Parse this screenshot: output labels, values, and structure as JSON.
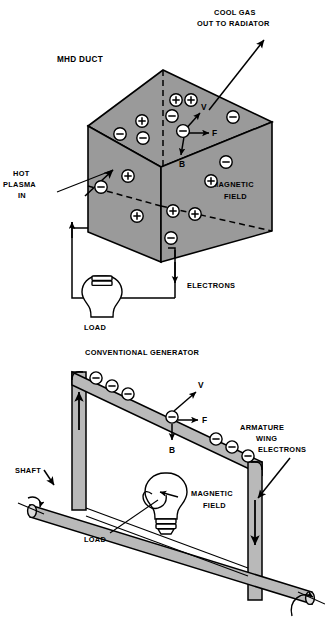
{
  "figure": {
    "background_color": "#ffffff",
    "stroke_color": "#000000",
    "face_gray": "#9a9a9a",
    "face_gray_light": "#b4b4b4",
    "bar_gray": "#b9b9b9"
  },
  "top_diagram": {
    "name": "mhd-duct",
    "title": "MHD DUCT",
    "labels": {
      "duct": "MHD DUCT",
      "cool_gas_line1": "COOL GAS",
      "cool_gas_line2": "OUT TO RADIATOR",
      "hot_plasma_line1": "HOT",
      "hot_plasma_line2": "PLASMA",
      "hot_plasma_line3": "IN",
      "magnetic_field_line1": "MAGNETIC",
      "magnetic_field_line2": "FIELD",
      "electrons": "ELECTRONS",
      "load": "LOAD"
    },
    "vectors": [
      {
        "name": "velocity",
        "symbol": "V",
        "direction": "up-right"
      },
      {
        "name": "force",
        "symbol": "F",
        "direction": "right"
      },
      {
        "name": "magnetic-flux",
        "symbol": "B",
        "direction": "down"
      }
    ],
    "charges_top_face": [
      {
        "sign": "-",
        "x": 120,
        "y": 134
      },
      {
        "sign": "+",
        "x": 142,
        "y": 121
      },
      {
        "sign": "-",
        "x": 143,
        "y": 138
      },
      {
        "sign": "+",
        "x": 176,
        "y": 100
      },
      {
        "sign": "+",
        "x": 191,
        "y": 100
      },
      {
        "sign": "-",
        "x": 172,
        "y": 116
      },
      {
        "sign": "-",
        "x": 183,
        "y": 130
      },
      {
        "sign": "-",
        "x": 233,
        "y": 117
      }
    ],
    "charges_left_face": [
      {
        "sign": "-",
        "x": 101,
        "y": 187
      },
      {
        "sign": "+",
        "x": 128,
        "y": 175
      },
      {
        "sign": "+",
        "x": 136,
        "y": 216
      }
    ],
    "charges_right_face": [
      {
        "sign": "-",
        "x": 226,
        "y": 162
      },
      {
        "sign": "+",
        "x": 210,
        "y": 180
      },
      {
        "sign": "+",
        "x": 172,
        "y": 210
      },
      {
        "sign": "+",
        "x": 194,
        "y": 213
      },
      {
        "sign": "-",
        "x": 170,
        "y": 237
      }
    ]
  },
  "bottom_diagram": {
    "name": "conventional-generator",
    "title": "CONVENTIONAL GENERATOR",
    "labels": {
      "title": "CONVENTIONAL GENERATOR",
      "armature_line1": "ARMATURE",
      "armature_line2": "WING",
      "electrons": "ELECTRONS",
      "shaft": "SHAFT",
      "magnetic_field_line1": "MAGNETIC",
      "magnetic_field_line2": "FIELD",
      "load": "LOAD"
    },
    "vectors": [
      {
        "name": "velocity",
        "symbol": "V",
        "direction": "up-right"
      },
      {
        "name": "force",
        "symbol": "F",
        "direction": "right"
      },
      {
        "name": "magnetic-flux",
        "symbol": "B",
        "direction": "down"
      }
    ],
    "electrons_on_wing": [
      {
        "sign": "-",
        "x": 96,
        "y": 377
      },
      {
        "sign": "-",
        "x": 112,
        "y": 388
      },
      {
        "sign": "-",
        "x": 128,
        "y": 398
      },
      {
        "sign": "-",
        "x": 173,
        "y": 417
      },
      {
        "sign": "-",
        "x": 218,
        "y": 443
      },
      {
        "sign": "-",
        "x": 234,
        "y": 452
      },
      {
        "sign": "-",
        "x": 249,
        "y": 461
      }
    ],
    "current_arrows": [
      {
        "name": "left-post-current",
        "direction": "up"
      },
      {
        "name": "right-post-current",
        "direction": "down"
      }
    ]
  }
}
